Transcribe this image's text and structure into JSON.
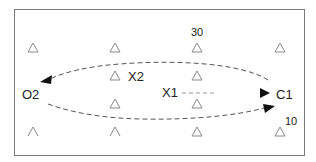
{
  "diagram": {
    "labels": {
      "o2": "O2",
      "c1": "C1",
      "x1": "X1",
      "x2": "X2",
      "top_value": "30",
      "bottom_value": "10"
    },
    "colors": {
      "border": "#7a7a7a",
      "triangle": "#8a8a8a",
      "dashed": "#555555",
      "arrowhead": "#111111",
      "text": "#222222"
    },
    "triangles": [
      {
        "x": 33,
        "y": 48,
        "shape": "triangle"
      },
      {
        "x": 115,
        "y": 48,
        "shape": "triangle"
      },
      {
        "x": 197,
        "y": 48,
        "shape": "triangle"
      },
      {
        "x": 280,
        "y": 48,
        "shape": "triangle"
      },
      {
        "x": 115,
        "y": 76,
        "shape": "triangle"
      },
      {
        "x": 197,
        "y": 76,
        "shape": "triangle"
      },
      {
        "x": 115,
        "y": 104,
        "shape": "triangle"
      },
      {
        "x": 197,
        "y": 104,
        "shape": "triangle"
      },
      {
        "x": 33,
        "y": 132,
        "shape": "caret"
      },
      {
        "x": 115,
        "y": 132,
        "shape": "caret"
      },
      {
        "x": 197,
        "y": 132,
        "shape": "triangle"
      },
      {
        "x": 280,
        "y": 132,
        "shape": "triangle"
      }
    ],
    "arrows": [
      {
        "name": "upper-arc-to-o2",
        "direction": "C1 to O2"
      },
      {
        "name": "lower-arc-to-c1",
        "direction": "O2 to C1"
      },
      {
        "name": "x1-dash-to-c1",
        "direction": "X1 to C1"
      }
    ]
  }
}
